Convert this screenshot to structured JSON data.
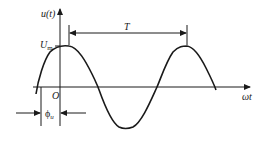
{
  "figure": {
    "type": "sine-waveform",
    "y_axis_label": "u(t)",
    "x_axis_label": "ωt",
    "origin_label": "O",
    "amplitude_label_main": "U",
    "amplitude_label_sub": "m",
    "period_label": "T",
    "phase_label_main": "ϕ",
    "phase_label_sub": "u",
    "stroke_color": "#1a1a1a",
    "background_color": "#ffffff"
  }
}
